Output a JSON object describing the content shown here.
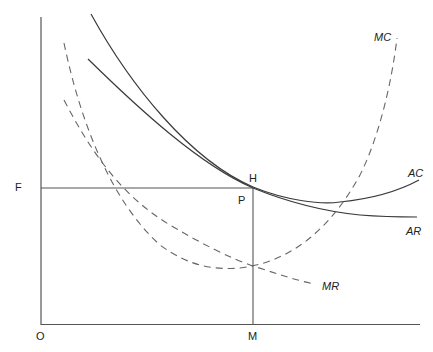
{
  "diagram": {
    "type": "economics-cost-revenue-curves",
    "axis_labels": {
      "origin": "O",
      "y_point": "F",
      "x_point": "M"
    },
    "point_labels": {
      "tangency": "H",
      "price": "P"
    },
    "curves": {
      "mc": {
        "label": "MC",
        "style": "dashed"
      },
      "ac": {
        "label": "AC",
        "style": "solid"
      },
      "ar": {
        "label": "AR",
        "style": "solid"
      },
      "mr": {
        "label": "MR",
        "style": "dashed"
      }
    },
    "colors": {
      "line": "#3a3a3a",
      "dashed": "#666666",
      "text": "#222222",
      "background": "#ffffff"
    }
  }
}
